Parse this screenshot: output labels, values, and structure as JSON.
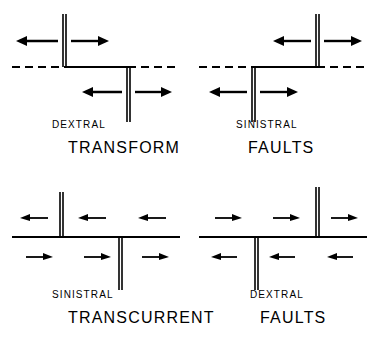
{
  "figure": {
    "stroke_color": "#000000",
    "background_color": "#ffffff"
  },
  "panels": [
    {
      "id": "top-left",
      "sense_label": "DEXTRAL",
      "type_label": "TRANSFORM",
      "fault_class": "transform",
      "slip_sense": "dextral",
      "plate_boundary_style": "dashed",
      "ridge_segments": [
        {
          "position": "upper-left",
          "arrow_directions": [
            "left",
            "right"
          ]
        },
        {
          "position": "lower-right",
          "arrow_directions": [
            "left",
            "right"
          ]
        }
      ],
      "offset_direction": "right-stepping",
      "arrow_pair_count": 2
    },
    {
      "id": "top-right",
      "sense_label": "SINISTRAL",
      "type_label": "FAULTS",
      "fault_class": "transform",
      "slip_sense": "sinistral",
      "plate_boundary_style": "dashed",
      "ridge_segments": [
        {
          "position": "upper-right",
          "arrow_directions": [
            "left",
            "right"
          ]
        },
        {
          "position": "lower-left",
          "arrow_directions": [
            "left",
            "right"
          ]
        }
      ],
      "offset_direction": "left-stepping",
      "arrow_pair_count": 2
    },
    {
      "id": "bottom-left",
      "sense_label": "SINISTRAL",
      "type_label": "TRANSCURRENT",
      "fault_class": "transcurrent",
      "slip_sense": "sinistral",
      "plate_boundary_style": "solid",
      "ridge_segments": [
        {
          "position": "upper-left",
          "arrow_directions": []
        },
        {
          "position": "lower-right",
          "arrow_directions": []
        }
      ],
      "shear_arrows": {
        "above_line": "left",
        "below_line": "right",
        "pairs_per_side": 3
      },
      "offset_direction": "none",
      "arrow_pair_count": 6
    },
    {
      "id": "bottom-right",
      "sense_label": "DEXTRAL",
      "type_label": "FAULTS",
      "fault_class": "transcurrent",
      "slip_sense": "dextral",
      "plate_boundary_style": "solid",
      "ridge_segments": [
        {
          "position": "lower-left",
          "arrow_directions": []
        },
        {
          "position": "upper-right",
          "arrow_directions": []
        }
      ],
      "shear_arrows": {
        "above_line": "right",
        "below_line": "left",
        "pairs_per_side": 3
      },
      "offset_direction": "none",
      "arrow_pair_count": 6
    }
  ]
}
